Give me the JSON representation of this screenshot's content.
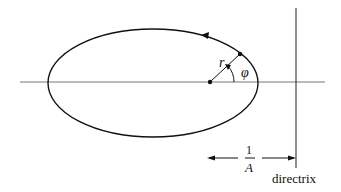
{
  "diagram": {
    "type": "conic-section-polar",
    "labels": {
      "radius": "r",
      "angle": "φ",
      "distance_numerator": "1",
      "distance_denominator": "A",
      "directrix": "directrix"
    },
    "colors": {
      "stroke": "#111111",
      "axis": "#777777",
      "background": "#ffffff"
    }
  }
}
